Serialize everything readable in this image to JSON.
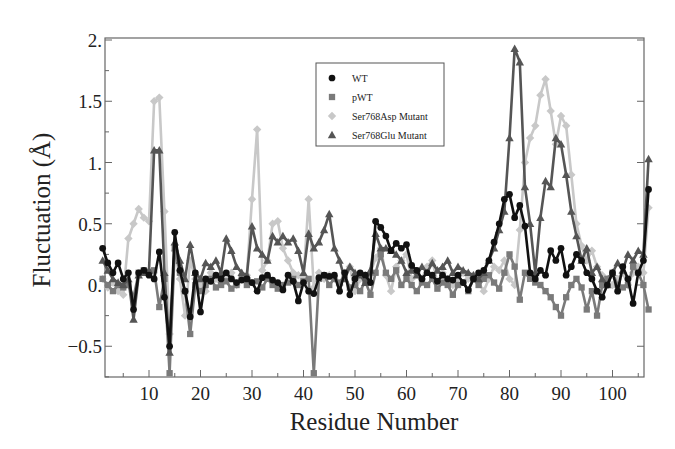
{
  "chart_data": {
    "type": "line",
    "title": "",
    "xlabel": "Residue Number",
    "ylabel": "Fluctuation (Å)",
    "xlim": [
      1,
      107
    ],
    "ylim": [
      -0.77,
      2.0
    ],
    "grid": false,
    "legend_position": "upper center (inside plot)",
    "x_ticks": [
      10,
      20,
      30,
      40,
      50,
      60,
      70,
      80,
      90,
      100
    ],
    "x_tick_labels": [
      "10",
      "20",
      "30",
      "40",
      "50",
      "60",
      "70",
      "80",
      "90",
      "100"
    ],
    "y_ticks": [
      -0.5,
      0,
      0.5,
      1,
      1.5,
      2
    ],
    "y_tick_labels": [
      "−0.5",
      "0.",
      "0.5",
      "1.",
      "1.5",
      "2."
    ],
    "x": [
      1,
      2,
      3,
      4,
      5,
      6,
      7,
      8,
      9,
      10,
      11,
      12,
      13,
      14,
      15,
      16,
      17,
      18,
      19,
      20,
      21,
      22,
      23,
      24,
      25,
      26,
      27,
      28,
      29,
      30,
      31,
      32,
      33,
      34,
      35,
      36,
      37,
      38,
      39,
      40,
      41,
      42,
      43,
      44,
      45,
      46,
      47,
      48,
      49,
      50,
      51,
      52,
      53,
      54,
      55,
      56,
      57,
      58,
      59,
      60,
      61,
      62,
      63,
      64,
      65,
      66,
      67,
      68,
      69,
      70,
      71,
      72,
      73,
      74,
      75,
      76,
      77,
      78,
      79,
      80,
      81,
      82,
      83,
      84,
      85,
      86,
      87,
      88,
      89,
      90,
      91,
      92,
      93,
      94,
      95,
      96,
      97,
      98,
      99,
      100,
      101,
      102,
      103,
      104,
      105,
      106,
      107
    ],
    "series": [
      {
        "name": "WT",
        "marker": "circle",
        "color": "#111111",
        "values": [
          0.3,
          0.18,
          0.1,
          0.18,
          0.05,
          0.1,
          -0.2,
          0.1,
          0.12,
          0.08,
          0.05,
          0.27,
          -0.1,
          -0.5,
          0.43,
          0.12,
          -0.05,
          -0.26,
          0.1,
          -0.22,
          0.05,
          0.03,
          0.08,
          0.05,
          0.1,
          0.05,
          0.02,
          0.04,
          0.05,
          0.02,
          -0.05,
          0.06,
          0.08,
          0.04,
          0.02,
          -0.04,
          0.08,
          0.03,
          -0.13,
          0.02,
          -0.05,
          -0.07,
          0.06,
          0.08,
          0.07,
          0.08,
          -0.05,
          0.1,
          -0.08,
          0.05,
          0.1,
          0.08,
          0.02,
          0.52,
          0.47,
          0.4,
          0.28,
          0.34,
          0.3,
          0.33,
          0.16,
          0.12,
          0.05,
          0.1,
          0.08,
          0.03,
          0.08,
          0.05,
          0.04,
          0.08,
          0.02,
          -0.04,
          0.05,
          0.1,
          0.12,
          0.2,
          0.35,
          0.5,
          0.7,
          0.74,
          0.55,
          0.65,
          0.48,
          0.1,
          0.05,
          0.12,
          0.08,
          0.28,
          0.2,
          0.3,
          0.08,
          0.15,
          0.25,
          0.2,
          0.1,
          0.05,
          -0.05,
          -0.1,
          0.0,
          0.1,
          -0.05,
          0.15,
          0.05,
          -0.15,
          0.1,
          0.2,
          0.78
        ]
      },
      {
        "name": "pWT",
        "marker": "square",
        "color": "#7a7a7a",
        "values": [
          0.05,
          0.0,
          -0.05,
          0.0,
          -0.02,
          0.0,
          -0.1,
          0.1,
          0.12,
          0.1,
          0.12,
          -0.18,
          0.05,
          -0.72,
          0.3,
          0.1,
          -0.05,
          -0.4,
          0.0,
          -0.05,
          0.0,
          0.05,
          -0.02,
          0.0,
          0.03,
          -0.03,
          0.0,
          0.05,
          0.0,
          0.02,
          0.03,
          -0.02,
          0.05,
          0.0,
          -0.03,
          0.0,
          0.02,
          0.05,
          0.0,
          0.03,
          0.05,
          -0.72,
          0.05,
          0.08,
          0.0,
          0.05,
          0.02,
          0.08,
          -0.02,
          0.0,
          -0.05,
          0.03,
          -0.08,
          0.1,
          0.25,
          0.1,
          0.05,
          0.12,
          0.0,
          0.05,
          0.0,
          -0.05,
          0.02,
          0.0,
          0.05,
          -0.03,
          0.02,
          0.0,
          -0.08,
          0.0,
          0.02,
          -0.05,
          0.05,
          0.0,
          0.05,
          0.08,
          0.02,
          -0.03,
          0.1,
          0.25,
          0.15,
          -0.12,
          0.1,
          0.05,
          0.02,
          0.0,
          -0.05,
          -0.1,
          -0.18,
          -0.25,
          -0.1,
          0.0,
          0.05,
          -0.02,
          -0.2,
          -0.05,
          -0.25,
          0.0,
          0.05,
          0.1,
          0.0,
          -0.02,
          0.0,
          0.15,
          0.1,
          0.0,
          -0.2
        ]
      },
      {
        "name": "Ser768Asp Mutant",
        "marker": "diamond",
        "color": "#c8c8c8",
        "values": [
          0.05,
          -0.02,
          0.02,
          -0.05,
          -0.08,
          0.38,
          0.5,
          0.62,
          0.55,
          0.52,
          1.5,
          1.53,
          0.6,
          -0.4,
          0.28,
          0.05,
          -0.25,
          0.2,
          0.05,
          0.0,
          -0.05,
          0.1,
          0.05,
          0.02,
          0.05,
          0.1,
          0.0,
          0.05,
          0.08,
          0.7,
          1.27,
          0.12,
          0.2,
          0.5,
          0.52,
          0.3,
          0.2,
          0.1,
          0.08,
          0.05,
          0.7,
          -0.02,
          0.1,
          0.05,
          0.08,
          0.05,
          0.0,
          0.1,
          0.15,
          -0.05,
          0.05,
          0.08,
          0.1,
          0.22,
          0.3,
          0.08,
          -0.05,
          0.15,
          0.2,
          0.25,
          0.05,
          0.1,
          0.05,
          0.15,
          0.2,
          0.02,
          0.1,
          0.05,
          0.0,
          0.05,
          0.1,
          0.05,
          0.08,
          0.02,
          -0.05,
          0.05,
          0.15,
          0.12,
          0.2,
          0.05,
          0.0,
          0.45,
          1.0,
          1.2,
          1.3,
          1.55,
          1.68,
          1.42,
          1.15,
          1.38,
          1.3,
          0.9,
          0.5,
          0.32,
          0.2,
          0.28,
          0.15,
          0.08,
          0.05,
          0.0,
          0.05,
          0.1,
          0.0,
          0.1,
          0.15,
          0.1,
          0.63
        ]
      },
      {
        "name": "Ser768Glu Mutant",
        "marker": "triangle",
        "color": "#555555",
        "values": [
          0.2,
          0.12,
          0.05,
          0.02,
          0.0,
          0.05,
          -0.28,
          0.08,
          0.1,
          0.12,
          1.1,
          1.1,
          0.1,
          -0.55,
          0.35,
          0.2,
          0.05,
          0.33,
          0.1,
          0.05,
          0.18,
          0.15,
          0.2,
          0.1,
          0.38,
          0.28,
          0.15,
          0.1,
          0.08,
          0.48,
          0.3,
          0.25,
          0.2,
          0.4,
          0.35,
          0.4,
          0.35,
          0.38,
          0.28,
          0.1,
          0.42,
          0.3,
          0.35,
          0.45,
          0.58,
          0.3,
          0.2,
          0.05,
          0.15,
          0.1,
          0.08,
          0.02,
          0.12,
          0.42,
          0.3,
          0.3,
          0.28,
          0.25,
          0.2,
          0.1,
          0.12,
          0.08,
          0.15,
          0.1,
          0.18,
          0.12,
          0.15,
          0.2,
          0.1,
          0.15,
          0.12,
          0.1,
          0.08,
          0.05,
          0.1,
          0.2,
          0.3,
          0.45,
          0.6,
          1.2,
          1.93,
          1.82,
          0.8,
          0.5,
          0.1,
          0.55,
          0.85,
          0.8,
          1.2,
          1.15,
          0.9,
          0.6,
          0.4,
          0.2,
          0.3,
          0.1,
          0.15,
          0.05,
          0.0,
          0.1,
          0.18,
          0.12,
          0.25,
          0.2,
          0.28,
          0.25,
          1.03
        ]
      }
    ]
  }
}
